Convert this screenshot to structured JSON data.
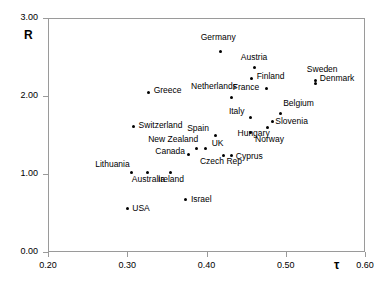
{
  "chart_data": {
    "type": "scatter",
    "title": "",
    "xlabel": "τ",
    "ylabel": "R",
    "xlim": [
      0.2,
      0.6
    ],
    "ylim": [
      0.0,
      3.0
    ],
    "xticks": [
      "0.20",
      "0.30",
      "0.40",
      "0.50",
      "0.60"
    ],
    "xtick_values": [
      0.2,
      0.3,
      0.4,
      0.5,
      0.6
    ],
    "yticks": [
      "0.00",
      "1.00",
      "2.00",
      "3.00"
    ],
    "ytick_values": [
      0.0,
      1.0,
      2.0,
      3.0
    ],
    "grid": false,
    "legend": false,
    "points": [
      {
        "label": "Germany",
        "x": 0.418,
        "y": 2.565,
        "lx": -20,
        "ly": -19
      },
      {
        "label": "Austria",
        "x": 0.461,
        "y": 2.359,
        "lx": -14,
        "ly": -15
      },
      {
        "label": "Finland",
        "x": 0.457,
        "y": 2.218,
        "lx": 5,
        "ly": -7
      },
      {
        "label": "Sweden",
        "x": 0.538,
        "y": 2.154,
        "lx": -9,
        "ly": -19
      },
      {
        "label": "Denmark",
        "x": 0.538,
        "y": 2.205,
        "lx": 4,
        "ly": -6
      },
      {
        "label": "Greece",
        "x": 0.327,
        "y": 2.051,
        "lx": 5,
        "ly": -6
      },
      {
        "label": "Netherlands",
        "x": 0.431,
        "y": 1.987,
        "lx": -40,
        "ly": -15
      },
      {
        "label": "France",
        "x": 0.476,
        "y": 2.09,
        "lx": -34,
        "ly": -6
      },
      {
        "label": "Belgium",
        "x": 0.493,
        "y": 1.782,
        "lx": 3,
        "ly": -14
      },
      {
        "label": "Italy",
        "x": 0.456,
        "y": 1.718,
        "lx": -22,
        "ly": -11
      },
      {
        "label": "Slovenia",
        "x": 0.483,
        "y": 1.667,
        "lx": 3,
        "ly": -5
      },
      {
        "label": "Hungary",
        "x": 0.477,
        "y": 1.59,
        "lx": -30,
        "ly": 1
      },
      {
        "label": "Norway",
        "x": 0.455,
        "y": 1.526,
        "lx": 5,
        "ly": 2
      },
      {
        "label": "Spain",
        "x": 0.411,
        "y": 1.5,
        "lx": -28,
        "ly": -11
      },
      {
        "label": "Switzerland",
        "x": 0.308,
        "y": 1.603,
        "lx": 5,
        "ly": -6
      },
      {
        "label": "New Zealand",
        "x": 0.387,
        "y": 1.333,
        "lx": -48,
        "ly": -13
      },
      {
        "label": "UK",
        "x": 0.399,
        "y": 1.333,
        "lx": 6,
        "ly": -9
      },
      {
        "label": "Canada",
        "x": 0.377,
        "y": 1.244,
        "lx": -33,
        "ly": -8
      },
      {
        "label": "Czech Rep",
        "x": 0.422,
        "y": 1.231,
        "lx": -24,
        "ly": 1
      },
      {
        "label": "Cyprus",
        "x": 0.432,
        "y": 1.231,
        "lx": 4,
        "ly": -4
      },
      {
        "label": "Lithuania",
        "x": 0.305,
        "y": 1.013,
        "lx": -36,
        "ly": -13
      },
      {
        "label": "Australia",
        "x": 0.326,
        "y": 1.013,
        "lx": -16,
        "ly": 2
      },
      {
        "label": "Ireland",
        "x": 0.354,
        "y": 1.013,
        "lx": -12,
        "ly": 2
      },
      {
        "label": "Israel",
        "x": 0.374,
        "y": 0.667,
        "lx": 5,
        "ly": -5
      },
      {
        "label": "USA",
        "x": 0.3,
        "y": 0.564,
        "lx": 5,
        "ly": -4
      }
    ]
  }
}
